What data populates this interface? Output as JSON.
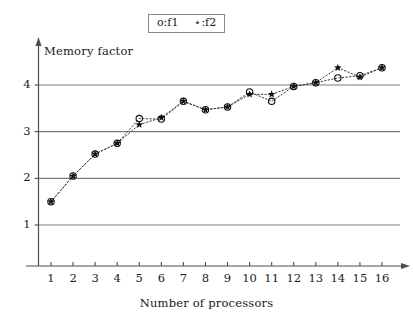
{
  "legend": {
    "entries": [
      {
        "marker": "circle-marker",
        "label": "o:f1"
      },
      {
        "marker": "star-marker",
        "label": "⋆:f2"
      }
    ]
  },
  "chart_data": {
    "type": "line",
    "title": "",
    "xlabel": "Number of processors",
    "ylabel": "Memory factor",
    "x": [
      1,
      2,
      3,
      4,
      5,
      6,
      7,
      8,
      9,
      10,
      11,
      12,
      13,
      14,
      15,
      16
    ],
    "xlim": [
      0.4,
      16.8
    ],
    "ylim": [
      0.35,
      4.75
    ],
    "xticks": [
      "1",
      "2",
      "3",
      "4",
      "5",
      "6",
      "7",
      "8",
      "9",
      "10",
      "11",
      "12",
      "13",
      "14",
      "15",
      "16"
    ],
    "yticks": [
      "1",
      "2",
      "3",
      "4"
    ],
    "grid": "horizontal",
    "legend_position": "top-center",
    "series": [
      {
        "name": "f1",
        "marker": "circle",
        "linestyle": "dotted",
        "values": [
          1.5,
          2.05,
          2.52,
          2.75,
          3.28,
          3.27,
          3.65,
          3.47,
          3.53,
          3.85,
          3.65,
          3.97,
          4.05,
          4.15,
          4.2,
          4.37
        ]
      },
      {
        "name": "f2",
        "marker": "star",
        "linestyle": "dotted",
        "values": [
          1.5,
          2.05,
          2.52,
          2.75,
          3.15,
          3.3,
          3.65,
          3.47,
          3.53,
          3.8,
          3.8,
          3.97,
          4.05,
          4.37,
          4.17,
          4.37
        ]
      }
    ]
  },
  "colors": {
    "axis": "#4d4d4d",
    "grid": "#7a7a7a",
    "marker": "#111111",
    "line": "#3a3a3a"
  }
}
